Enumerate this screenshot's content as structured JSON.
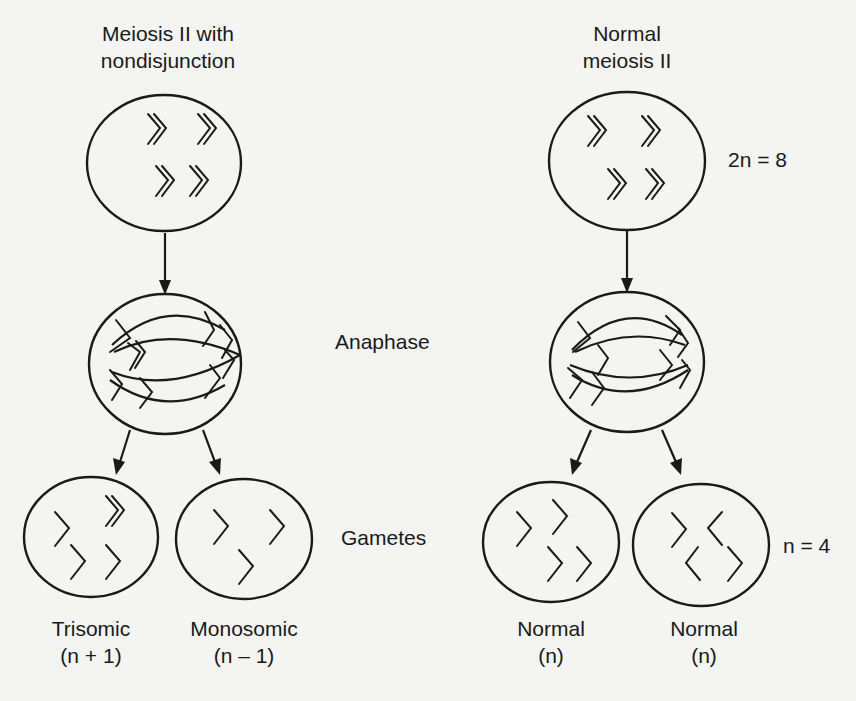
{
  "columns": {
    "nondisjunction": {
      "title_line1": "Meiosis II with",
      "title_line2": "nondisjunction"
    },
    "normal": {
      "title_line1": "Normal",
      "title_line2": "meiosis II"
    }
  },
  "stage_labels": {
    "anaphase": "Anaphase",
    "gametes": "Gametes"
  },
  "ploidy_labels": {
    "diploid": "2n = 8",
    "haploid": "n = 4"
  },
  "gametes": [
    {
      "name": "Trisomic",
      "formula": "(n + 1)"
    },
    {
      "name": "Monosomic",
      "formula": "(n – 1)"
    },
    {
      "name": "Normal",
      "formula": "(n)"
    },
    {
      "name": "Normal",
      "formula": "(n)"
    }
  ],
  "colors": {
    "background": "#f4f4f2",
    "ink": "#1a1a1a"
  }
}
